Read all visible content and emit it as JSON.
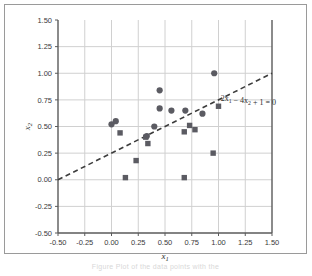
{
  "figure": {
    "background_color": "#ffffff",
    "frame_color": "#9a9a9a",
    "caption_fragment": "Figure  Plot of the data points with the"
  },
  "chart_data": {
    "type": "scatter",
    "title": "",
    "xlabel": "x₁",
    "ylabel": "x₂",
    "xlim": [
      -0.5,
      1.5
    ],
    "ylim": [
      -0.5,
      1.5
    ],
    "xticks": [
      -0.5,
      -0.25,
      0,
      0.25,
      0.5,
      0.75,
      1.0,
      1.25,
      1.5
    ],
    "yticks": [
      -0.5,
      -0.25,
      0,
      0.25,
      0.5,
      0.75,
      1.0,
      1.25,
      1.5
    ],
    "xticklabels": [
      "-0.50",
      "-0.25",
      "0.00",
      "0.25",
      "0.50",
      "0.75",
      "1.00",
      "1.25",
      "1.50"
    ],
    "yticklabels": [
      "-0.50",
      "-0.25",
      "0.00",
      "0.25",
      "0.50",
      "0.75",
      "1.00",
      "1.25",
      "1.50"
    ],
    "grid": true,
    "grid_color": "#d0d0d0",
    "axis_color": "#5a5a5a",
    "legend": "none",
    "marker_color": "#5b5b62",
    "series": [
      {
        "name": "class-circle",
        "marker": "circle",
        "points": [
          [
            0.0,
            0.52
          ],
          [
            0.04,
            0.55
          ],
          [
            0.33,
            0.41
          ],
          [
            0.4,
            0.5
          ],
          [
            0.45,
            0.84
          ],
          [
            0.45,
            0.67
          ],
          [
            0.56,
            0.65
          ],
          [
            0.69,
            0.65
          ],
          [
            0.85,
            0.62
          ],
          [
            0.96,
            1.0
          ]
        ]
      },
      {
        "name": "class-square",
        "marker": "square",
        "points": [
          [
            0.08,
            0.44
          ],
          [
            0.13,
            0.02
          ],
          [
            0.23,
            0.18
          ],
          [
            0.32,
            0.4
          ],
          [
            0.34,
            0.34
          ],
          [
            0.68,
            0.45
          ],
          [
            0.68,
            0.02
          ],
          [
            0.73,
            0.51
          ],
          [
            0.78,
            0.47
          ],
          [
            0.95,
            0.25
          ],
          [
            1.0,
            0.69
          ]
        ]
      }
    ],
    "annotations": [
      {
        "name": "decision-boundary-equation",
        "text": "2x₁ − 4x₂ + 1 = 0",
        "x": 1.02,
        "y": 0.74
      }
    ],
    "lines": [
      {
        "name": "decision-boundary",
        "style": "dashed",
        "color": "#3c3c3c",
        "equation": "2x1 - 4x2 + 1 = 0",
        "from": [
          -0.5,
          0.0
        ],
        "to": [
          1.5,
          1.0
        ]
      }
    ]
  }
}
